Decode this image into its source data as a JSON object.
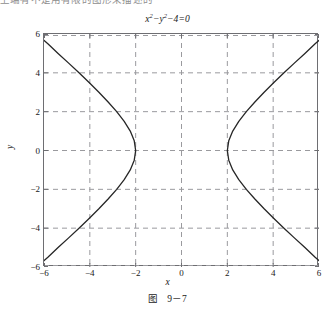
{
  "page": {
    "top_clipped_text": "上端有不是用有限的图形来描述的",
    "background_color": "#ffffff"
  },
  "figure": {
    "title_base": "x",
    "title_full": "x²−y²−4=0",
    "caption_label": "图",
    "caption_number": "9－7",
    "axis_color": "#6e6e72",
    "grid_color": "#9a9a9e",
    "curve_color": "#262626"
  },
  "chart_data": {
    "type": "line",
    "xlabel": "x",
    "ylabel": "y",
    "xlim": [
      -6,
      6
    ],
    "ylim": [
      -6,
      6
    ],
    "grid": true,
    "legend": "none",
    "xticks": [
      -6,
      -4,
      -2,
      0,
      2,
      4,
      6
    ],
    "yticks": [
      -6,
      -4,
      -2,
      0,
      2,
      4,
      6
    ],
    "xticklabels": [
      "-6",
      "-4",
      "-2",
      "0",
      "2",
      "4",
      "6"
    ],
    "yticklabels": [
      "-6",
      "-4",
      "-2",
      "0",
      "2",
      "4",
      "6"
    ],
    "equation": "x^2 - y^2 - 4 = 0",
    "curve_kind": "hyperbola",
    "vertices": [
      [
        -2,
        0
      ],
      [
        2,
        0
      ]
    ],
    "asymptotes": [
      "y = x",
      "y = -x"
    ],
    "series": [
      {
        "name": "left-branch",
        "comment": "x = -sqrt(y^2+4), y from -6 to 6",
        "points": [
          [
            -6.3246,
            -6.0
          ],
          [
            -5.831,
            -5.5
          ],
          [
            -5.3852,
            -5.0
          ],
          [
            -4.9244,
            -4.5
          ],
          [
            -4.4721,
            -4.0
          ],
          [
            -4.0311,
            -3.5
          ],
          [
            -3.6056,
            -3.0
          ],
          [
            -3.2016,
            -2.5
          ],
          [
            -2.8284,
            -2.0
          ],
          [
            -2.5,
            -1.5
          ],
          [
            -2.2361,
            -1.0
          ],
          [
            -2.0616,
            -0.5
          ],
          [
            -2.0,
            0.0
          ],
          [
            -2.0616,
            0.5
          ],
          [
            -2.2361,
            1.0
          ],
          [
            -2.5,
            1.5
          ],
          [
            -2.8284,
            2.0
          ],
          [
            -3.2016,
            2.5
          ],
          [
            -3.6056,
            3.0
          ],
          [
            -4.0311,
            3.5
          ],
          [
            -4.4721,
            4.0
          ],
          [
            -4.9244,
            4.5
          ],
          [
            -5.3852,
            5.0
          ],
          [
            -5.831,
            5.5
          ],
          [
            -6.3246,
            6.0
          ]
        ]
      },
      {
        "name": "right-branch",
        "comment": "x = +sqrt(y^2+4), y from -6 to 6",
        "points": [
          [
            6.3246,
            -6.0
          ],
          [
            5.831,
            -5.5
          ],
          [
            5.3852,
            -5.0
          ],
          [
            4.9244,
            -4.5
          ],
          [
            4.4721,
            -4.0
          ],
          [
            4.0311,
            -3.5
          ],
          [
            3.6056,
            -3.0
          ],
          [
            3.2016,
            -2.5
          ],
          [
            2.8284,
            -2.0
          ],
          [
            2.5,
            -1.5
          ],
          [
            2.2361,
            -1.0
          ],
          [
            2.0616,
            -0.5
          ],
          [
            2.0,
            0.0
          ],
          [
            2.0616,
            0.5
          ],
          [
            2.2361,
            1.0
          ],
          [
            2.5,
            1.5
          ],
          [
            2.8284,
            2.0
          ],
          [
            3.2016,
            2.5
          ],
          [
            3.6056,
            3.0
          ],
          [
            4.0311,
            3.5
          ],
          [
            4.4721,
            4.0
          ],
          [
            4.9244,
            4.5
          ],
          [
            5.3852,
            5.0
          ],
          [
            5.831,
            5.5
          ],
          [
            6.3246,
            6.0
          ]
        ]
      }
    ]
  }
}
